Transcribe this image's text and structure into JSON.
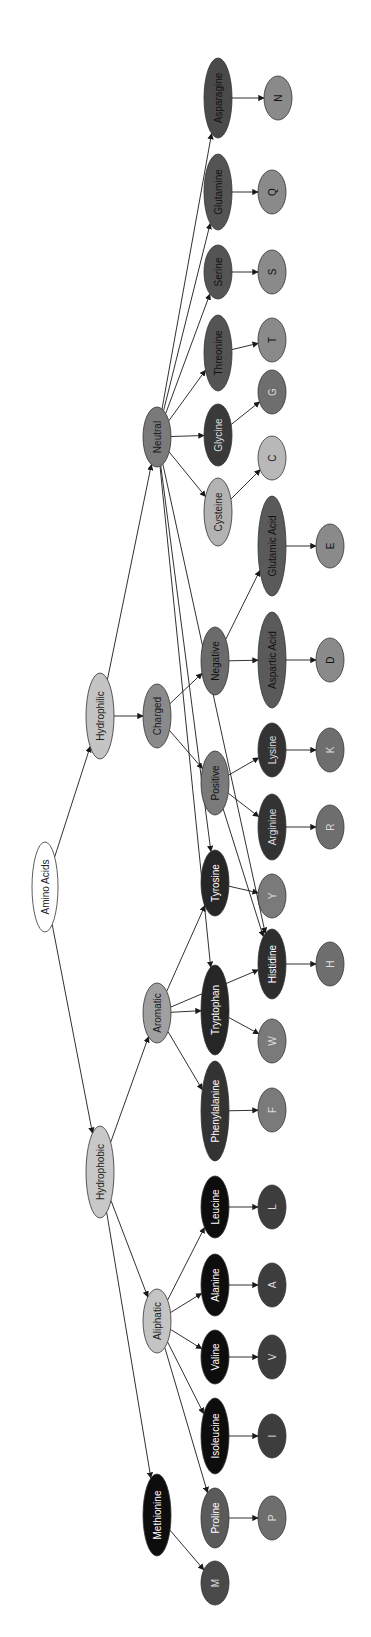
{
  "diagram": {
    "title": "Amino Acids",
    "orientation": "rotated-90-clockwise",
    "colors": {
      "root": "#ffffff",
      "category_light": "#c8c8c8",
      "category_mid": "#8c8c8c",
      "neutral_group": "#5e5e5e",
      "charged_acid": "#5a5a5a",
      "dark_residue": "#2e2e2e",
      "black_residue": "#0d0d0d",
      "letter_gray": "#7a7a7a",
      "letter_dark": "#3d3d3d",
      "letter_light": "#b5b5b5",
      "edge": "#1a1a1a"
    },
    "nodes": [
      {
        "id": "amino_acids",
        "label": "Amino Acids",
        "cx": 45,
        "cy": 887,
        "rx": 13,
        "ry": 45,
        "fill": "#ffffff",
        "text": "#222222"
      },
      {
        "id": "hydrophilic",
        "label": "Hydrophilic",
        "cx": 100,
        "cy": 716,
        "rx": 14,
        "ry": 43,
        "fill": "#c4c4c4",
        "text": "#222222"
      },
      {
        "id": "hydrophobic",
        "label": "Hydrophobic",
        "cx": 100,
        "cy": 1172,
        "rx": 14,
        "ry": 46,
        "fill": "#c8c8c8",
        "text": "#222222"
      },
      {
        "id": "charged",
        "label": "Charged",
        "cx": 157,
        "cy": 716,
        "rx": 14,
        "ry": 32,
        "fill": "#8a8a8a",
        "text": "#1a1a1a"
      },
      {
        "id": "neutral",
        "label": "Neutral",
        "cx": 157,
        "cy": 437,
        "rx": 14,
        "ry": 30,
        "fill": "#7a7a7a",
        "text": "#1a1a1a"
      },
      {
        "id": "aromatic",
        "label": "Aromatic",
        "cx": 157,
        "cy": 1013,
        "rx": 14,
        "ry": 30,
        "fill": "#a0a0a0",
        "text": "#1a1a1a"
      },
      {
        "id": "aliphatic",
        "label": "Aliphatic",
        "cx": 157,
        "cy": 1321,
        "rx": 14,
        "ry": 32,
        "fill": "#c4c4c4",
        "text": "#1a1a1a"
      },
      {
        "id": "methionine",
        "label": "Methionine",
        "cx": 157,
        "cy": 1515,
        "rx": 14,
        "ry": 41,
        "fill": "#0d0d0d",
        "text": "#ffffff"
      },
      {
        "id": "negative",
        "label": "Negative",
        "cx": 215,
        "cy": 661,
        "rx": 14,
        "ry": 34,
        "fill": "#6b6b6b",
        "text": "#111111"
      },
      {
        "id": "positive",
        "label": "Positive",
        "cx": 215,
        "cy": 783,
        "rx": 14,
        "ry": 32,
        "fill": "#7a7a7a",
        "text": "#111111"
      },
      {
        "id": "tyrosine",
        "label": "Tyrosine",
        "cx": 215,
        "cy": 883,
        "rx": 14,
        "ry": 33,
        "fill": "#262626",
        "text": "#ffffff"
      },
      {
        "id": "tryptophan",
        "label": "Tryptophan",
        "cx": 215,
        "cy": 1010,
        "rx": 14,
        "ry": 45,
        "fill": "#262626",
        "text": "#ffffff"
      },
      {
        "id": "phenylalanine",
        "label": "Phenylalanine",
        "cx": 215,
        "cy": 1111,
        "rx": 14,
        "ry": 50,
        "fill": "#333333",
        "text": "#ffffff"
      },
      {
        "id": "leucine",
        "label": "Leucine",
        "cx": 215,
        "cy": 1207,
        "rx": 14,
        "ry": 31,
        "fill": "#0d0d0d",
        "text": "#ffffff"
      },
      {
        "id": "alanine",
        "label": "Alanine",
        "cx": 215,
        "cy": 1285,
        "rx": 14,
        "ry": 31,
        "fill": "#0d0d0d",
        "text": "#ffffff"
      },
      {
        "id": "valine",
        "label": "Valine",
        "cx": 215,
        "cy": 1357,
        "rx": 14,
        "ry": 27,
        "fill": "#0d0d0d",
        "text": "#ffffff"
      },
      {
        "id": "isoleucine",
        "label": "Isoleucine",
        "cx": 215,
        "cy": 1436,
        "rx": 14,
        "ry": 38,
        "fill": "#0d0d0d",
        "text": "#ffffff"
      },
      {
        "id": "proline",
        "label": "Proline",
        "cx": 215,
        "cy": 1518,
        "rx": 14,
        "ry": 30,
        "fill": "#5a5a5a",
        "text": "#ffffff"
      },
      {
        "id": "cysteine",
        "label": "Cysteine",
        "cx": 218,
        "cy": 512,
        "rx": 14,
        "ry": 34,
        "fill": "#b3b3b3",
        "text": "#222222"
      },
      {
        "id": "glycine",
        "label": "Glycine",
        "cx": 218,
        "cy": 435,
        "rx": 14,
        "ry": 31,
        "fill": "#3a3a3a",
        "text": "#dddddd"
      },
      {
        "id": "threonine",
        "label": "Threonine",
        "cx": 218,
        "cy": 353,
        "rx": 14,
        "ry": 38,
        "fill": "#545454",
        "text": "#111111"
      },
      {
        "id": "serine",
        "label": "Serine",
        "cx": 218,
        "cy": 272,
        "rx": 14,
        "ry": 27,
        "fill": "#545454",
        "text": "#111111"
      },
      {
        "id": "glutamine",
        "label": "Glutamine",
        "cx": 218,
        "cy": 192,
        "rx": 14,
        "ry": 38,
        "fill": "#545454",
        "text": "#111111"
      },
      {
        "id": "asparagine",
        "label": "Asparagine",
        "cx": 218,
        "cy": 98,
        "rx": 14,
        "ry": 40,
        "fill": "#4a4a4a",
        "text": "#111111"
      },
      {
        "id": "glutamic_acid",
        "label": "Glutamic Acid",
        "cx": 272,
        "cy": 546,
        "rx": 14,
        "ry": 50,
        "fill": "#5a5a5a",
        "text": "#111111"
      },
      {
        "id": "aspartic_acid",
        "label": "Aspartic Acid",
        "cx": 272,
        "cy": 660,
        "rx": 14,
        "ry": 48,
        "fill": "#5a5a5a",
        "text": "#111111"
      },
      {
        "id": "lysine",
        "label": "Lysine",
        "cx": 272,
        "cy": 750,
        "rx": 14,
        "ry": 27,
        "fill": "#333333",
        "text": "#dddddd"
      },
      {
        "id": "arginine",
        "label": "Arginine",
        "cx": 272,
        "cy": 827,
        "rx": 14,
        "ry": 33,
        "fill": "#333333",
        "text": "#dddddd"
      },
      {
        "id": "histidine",
        "label": "Histidine",
        "cx": 272,
        "cy": 964,
        "rx": 14,
        "ry": 35,
        "fill": "#2e2e2e",
        "text": "#ffffff"
      },
      {
        "id": "n",
        "label": "N",
        "cx": 278,
        "cy": 98,
        "rx": 14,
        "ry": 22,
        "fill": "#8a8a8a",
        "text": "#111111"
      },
      {
        "id": "q",
        "label": "Q",
        "cx": 272,
        "cy": 192,
        "rx": 14,
        "ry": 22,
        "fill": "#8a8a8a",
        "text": "#111111"
      },
      {
        "id": "s",
        "label": "S",
        "cx": 272,
        "cy": 272,
        "rx": 14,
        "ry": 22,
        "fill": "#8a8a8a",
        "text": "#111111"
      },
      {
        "id": "t",
        "label": "T",
        "cx": 272,
        "cy": 340,
        "rx": 14,
        "ry": 22,
        "fill": "#8a8a8a",
        "text": "#111111"
      },
      {
        "id": "g",
        "label": "G",
        "cx": 272,
        "cy": 392,
        "rx": 14,
        "ry": 22,
        "fill": "#6e6e6e",
        "text": "#dddddd"
      },
      {
        "id": "c",
        "label": "C",
        "cx": 272,
        "cy": 458,
        "rx": 14,
        "ry": 22,
        "fill": "#b8b8b8",
        "text": "#222222"
      },
      {
        "id": "e",
        "label": "E",
        "cx": 330,
        "cy": 546,
        "rx": 14,
        "ry": 22,
        "fill": "#8a8a8a",
        "text": "#111111"
      },
      {
        "id": "d",
        "label": "D",
        "cx": 330,
        "cy": 660,
        "rx": 14,
        "ry": 22,
        "fill": "#8a8a8a",
        "text": "#111111"
      },
      {
        "id": "k",
        "label": "K",
        "cx": 330,
        "cy": 750,
        "rx": 14,
        "ry": 22,
        "fill": "#6e6e6e",
        "text": "#dddddd"
      },
      {
        "id": "r",
        "label": "R",
        "cx": 330,
        "cy": 827,
        "rx": 14,
        "ry": 22,
        "fill": "#6e6e6e",
        "text": "#dddddd"
      },
      {
        "id": "y",
        "label": "Y",
        "cx": 272,
        "cy": 896,
        "rx": 14,
        "ry": 22,
        "fill": "#7a7a7a",
        "text": "#dddddd"
      },
      {
        "id": "h",
        "label": "H",
        "cx": 330,
        "cy": 964,
        "rx": 14,
        "ry": 22,
        "fill": "#6e6e6e",
        "text": "#dddddd"
      },
      {
        "id": "w",
        "label": "W",
        "cx": 272,
        "cy": 1041,
        "rx": 14,
        "ry": 22,
        "fill": "#7a7a7a",
        "text": "#dddddd"
      },
      {
        "id": "f",
        "label": "F",
        "cx": 272,
        "cy": 1110,
        "rx": 14,
        "ry": 22,
        "fill": "#7a7a7a",
        "text": "#dddddd"
      },
      {
        "id": "l",
        "label": "L",
        "cx": 272,
        "cy": 1207,
        "rx": 14,
        "ry": 22,
        "fill": "#3d3d3d",
        "text": "#dddddd"
      },
      {
        "id": "a",
        "label": "A",
        "cx": 272,
        "cy": 1285,
        "rx": 14,
        "ry": 22,
        "fill": "#3d3d3d",
        "text": "#dddddd"
      },
      {
        "id": "v",
        "label": "V",
        "cx": 272,
        "cy": 1357,
        "rx": 14,
        "ry": 22,
        "fill": "#3d3d3d",
        "text": "#dddddd"
      },
      {
        "id": "i",
        "label": "I",
        "cx": 272,
        "cy": 1436,
        "rx": 14,
        "ry": 22,
        "fill": "#3d3d3d",
        "text": "#dddddd"
      },
      {
        "id": "p",
        "label": "P",
        "cx": 272,
        "cy": 1518,
        "rx": 14,
        "ry": 22,
        "fill": "#6e6e6e",
        "text": "#dddddd"
      },
      {
        "id": "m",
        "label": "M",
        "cx": 215,
        "cy": 1583,
        "rx": 14,
        "ry": 22,
        "fill": "#4a4a4a",
        "text": "#dddddd"
      }
    ],
    "edges": [
      [
        "amino_acids",
        "hydrophilic"
      ],
      [
        "amino_acids",
        "hydrophobic"
      ],
      [
        "hydrophilic",
        "charged"
      ],
      [
        "hydrophilic",
        "neutral"
      ],
      [
        "hydrophobic",
        "aromatic"
      ],
      [
        "hydrophobic",
        "aliphatic"
      ],
      [
        "hydrophobic",
        "methionine"
      ],
      [
        "charged",
        "negative"
      ],
      [
        "charged",
        "positive"
      ],
      [
        "neutral",
        "asparagine"
      ],
      [
        "neutral",
        "glutamine"
      ],
      [
        "neutral",
        "serine"
      ],
      [
        "neutral",
        "threonine"
      ],
      [
        "neutral",
        "glycine"
      ],
      [
        "neutral",
        "cysteine"
      ],
      [
        "neutral",
        "tyrosine"
      ],
      [
        "neutral",
        "tryptophan"
      ],
      [
        "neutral",
        "histidine"
      ],
      [
        "negative",
        "aspartic_acid"
      ],
      [
        "negative",
        "glutamic_acid"
      ],
      [
        "positive",
        "lysine"
      ],
      [
        "positive",
        "arginine"
      ],
      [
        "positive",
        "histidine"
      ],
      [
        "aromatic",
        "tyrosine"
      ],
      [
        "aromatic",
        "tryptophan"
      ],
      [
        "aromatic",
        "phenylalanine"
      ],
      [
        "aromatic",
        "histidine"
      ],
      [
        "aliphatic",
        "leucine"
      ],
      [
        "aliphatic",
        "alanine"
      ],
      [
        "aliphatic",
        "valine"
      ],
      [
        "aliphatic",
        "isoleucine"
      ],
      [
        "aliphatic",
        "proline"
      ],
      [
        "asparagine",
        "n"
      ],
      [
        "glutamine",
        "q"
      ],
      [
        "serine",
        "s"
      ],
      [
        "threonine",
        "t"
      ],
      [
        "glycine",
        "g"
      ],
      [
        "cysteine",
        "c"
      ],
      [
        "glutamic_acid",
        "e"
      ],
      [
        "aspartic_acid",
        "d"
      ],
      [
        "lysine",
        "k"
      ],
      [
        "arginine",
        "r"
      ],
      [
        "tyrosine",
        "y"
      ],
      [
        "histidine",
        "h"
      ],
      [
        "tryptophan",
        "w"
      ],
      [
        "phenylalanine",
        "f"
      ],
      [
        "leucine",
        "l"
      ],
      [
        "alanine",
        "a"
      ],
      [
        "valine",
        "v"
      ],
      [
        "isoleucine",
        "i"
      ],
      [
        "proline",
        "p"
      ],
      [
        "methionine",
        "m"
      ]
    ]
  }
}
